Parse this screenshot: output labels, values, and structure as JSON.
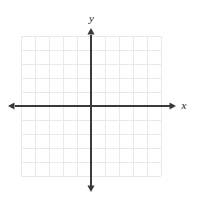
{
  "figure": {
    "width": 197,
    "height": 203,
    "background_color": "#ffffff"
  },
  "chart_data": {
    "type": "scatter",
    "title": "",
    "subtitle": "",
    "xlabel": "x",
    "ylabel": "y",
    "series": [
      {
        "name": "",
        "x": [],
        "y": []
      }
    ],
    "x": [],
    "values": [],
    "categories": [],
    "xlim": [
      -5,
      5
    ],
    "ylim": [
      -5,
      5
    ],
    "xticks": [
      -5,
      -4,
      -3,
      -2,
      -1,
      0,
      1,
      2,
      3,
      4,
      5
    ],
    "yticks": [
      -5,
      -4,
      -3,
      -2,
      -1,
      0,
      1,
      2,
      3,
      4,
      5
    ],
    "xtick_labels": [],
    "ytick_labels": [],
    "grid": true,
    "grid_columns": 10,
    "grid_rows": 10,
    "grid_color": "#e9e9e9",
    "axis_color": "#3a3a3a",
    "legend": [],
    "legend_position": "none",
    "annotations": [],
    "origin_label": ""
  },
  "axes": {
    "x_axis_label": "x",
    "y_axis_label": "y"
  },
  "geometry": {
    "origin_x": 91,
    "origin_y": 106,
    "cell_size": 14,
    "grid_left": 21,
    "grid_top": 36,
    "grid_right": 161,
    "grid_bottom": 176,
    "x_axis_start": 8,
    "x_axis_end": 176,
    "y_axis_start": 28,
    "y_axis_end": 192
  }
}
